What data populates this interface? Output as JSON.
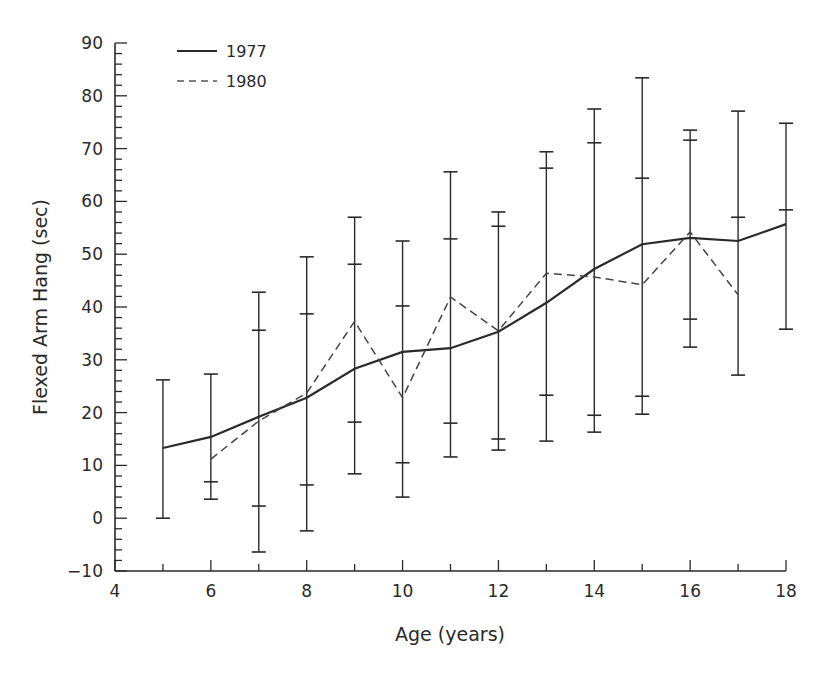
{
  "chart_data": {
    "type": "line",
    "title": "",
    "xlabel": "Age (years)",
    "ylabel": "Flexed Arm Hang (sec)",
    "xlim": [
      4,
      18
    ],
    "ylim": [
      -10,
      90
    ],
    "x_ticks": [
      4,
      6,
      8,
      10,
      12,
      14,
      16,
      18
    ],
    "y_ticks": [
      -10,
      0,
      10,
      20,
      30,
      40,
      50,
      60,
      70,
      80,
      90
    ],
    "grid": false,
    "legend_position": "upper-left",
    "series": [
      {
        "name": "1977",
        "style": "solid",
        "x": [
          5,
          6,
          7,
          8,
          9,
          10,
          11,
          12,
          13,
          14,
          15,
          16,
          17,
          18
        ],
        "values": [
          13.3,
          15.4,
          19.2,
          22.8,
          28.3,
          31.5,
          32.2,
          35.3,
          40.8,
          47.2,
          51.9,
          53.1,
          52.5,
          55.7
        ]
      },
      {
        "name": "1980",
        "style": "dashed",
        "x": [
          6,
          7,
          8,
          9,
          10,
          11,
          12,
          13,
          14,
          15,
          16,
          17
        ],
        "values": [
          11.2,
          18.4,
          23.7,
          37.3,
          22.8,
          41.9,
          35.5,
          46.4,
          45.7,
          44.2,
          54.2,
          42.3
        ]
      }
    ],
    "error_bars": [
      {
        "x": 5,
        "low": 0.0,
        "high": 26.2,
        "caps": [
          26.2,
          0.0
        ]
      },
      {
        "x": 6,
        "low": 3.6,
        "high": 27.3,
        "caps": [
          27.3,
          6.9,
          3.6
        ]
      },
      {
        "x": 7,
        "low": -6.4,
        "high": 42.8,
        "caps": [
          42.8,
          35.6,
          2.3,
          -6.4
        ]
      },
      {
        "x": 8,
        "low": -2.4,
        "high": 49.5,
        "caps": [
          49.5,
          38.7,
          6.3,
          -2.4
        ]
      },
      {
        "x": 9,
        "low": 8.4,
        "high": 57.0,
        "caps": [
          57.0,
          48.1,
          18.2,
          8.4
        ]
      },
      {
        "x": 10,
        "low": 4.0,
        "high": 52.5,
        "caps": [
          52.5,
          40.2,
          10.5,
          4.0
        ]
      },
      {
        "x": 11,
        "low": 11.6,
        "high": 65.6,
        "caps": [
          65.6,
          52.9,
          18.0,
          11.6
        ]
      },
      {
        "x": 12,
        "low": 12.9,
        "high": 58.0,
        "caps": [
          58.0,
          55.3,
          15.0,
          12.9
        ]
      },
      {
        "x": 13,
        "low": 14.6,
        "high": 69.4,
        "caps": [
          69.4,
          66.3,
          23.3,
          14.6
        ]
      },
      {
        "x": 14,
        "low": 16.3,
        "high": 77.5,
        "caps": [
          77.5,
          71.1,
          19.5,
          16.3
        ]
      },
      {
        "x": 15,
        "low": 19.7,
        "high": 83.4,
        "caps": [
          83.4,
          64.4,
          23.1,
          19.7
        ]
      },
      {
        "x": 16,
        "low": 32.4,
        "high": 73.5,
        "caps": [
          73.5,
          71.6,
          37.7,
          32.4
        ]
      },
      {
        "x": 17,
        "low": 27.1,
        "high": 77.1,
        "caps": [
          77.1,
          57.0,
          27.1
        ]
      },
      {
        "x": 18,
        "low": 35.8,
        "high": 74.8,
        "caps": [
          74.8,
          58.4,
          35.8
        ]
      }
    ]
  },
  "legend": {
    "items": [
      {
        "label": "1977",
        "style": "solid"
      },
      {
        "label": "1980",
        "style": "dashed"
      }
    ]
  },
  "axes": {
    "x_title": "Age (years)",
    "y_title": "Flexed Arm Hang (sec)"
  },
  "colors": {
    "ink": "#2a2a2a",
    "background": "#ffffff"
  }
}
